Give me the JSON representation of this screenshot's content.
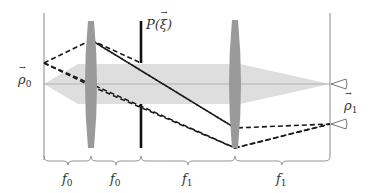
{
  "diagram": {
    "type": "4f optical imaging system",
    "labels": {
      "input_plane": "ρ",
      "input_plane_sub": "0",
      "output_plane": "ρ",
      "output_plane_sub": "1",
      "aperture": "P(",
      "aperture_arg": "ξ",
      "aperture_close": ")"
    },
    "focal_lengths": [
      {
        "symbol": "f",
        "sub": "0"
      },
      {
        "symbol": "f",
        "sub": "0"
      },
      {
        "symbol": "f",
        "sub": "1"
      },
      {
        "symbol": "f",
        "sub": "1"
      }
    ],
    "colors": {
      "lens": "#9a9a9a",
      "beam": "#dcdcdc",
      "ray": "#1a1a1a",
      "axis": "#a0a0a0",
      "plane": "#888888",
      "aperture": "#111111"
    }
  }
}
